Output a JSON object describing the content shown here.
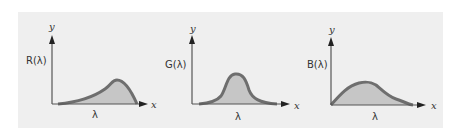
{
  "figure": {
    "background_color": "#efefef",
    "curve_color": "#6e6e6e",
    "fill_color": "#c6c6c6",
    "axis_color": "#555555",
    "panels": [
      {
        "id": "red",
        "ylabel": "R(λ)",
        "xlabel": "λ",
        "x_axis": "x",
        "y_axis": "y",
        "shape": "skewed peak toward long wavelengths"
      },
      {
        "id": "green",
        "ylabel": "G(λ)",
        "xlabel": "λ",
        "x_axis": "x",
        "y_axis": "y",
        "shape": "narrow peak at middle wavelengths"
      },
      {
        "id": "blue",
        "ylabel": "B(λ)",
        "xlabel": "λ",
        "x_axis": "x",
        "y_axis": "y",
        "shape": "broad peak toward short wavelengths"
      }
    ]
  }
}
